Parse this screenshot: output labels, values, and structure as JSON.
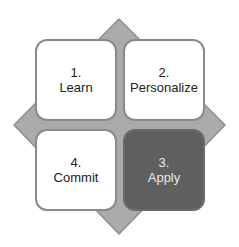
{
  "diagram": {
    "colors": {
      "diamond_fill": "#ababab",
      "diamond_stroke": "#8e8e8e",
      "box_light": "#ffffff",
      "box_dark": "#5f5f5f"
    },
    "steps": [
      {
        "number": "1.",
        "label": "Learn"
      },
      {
        "number": "2.",
        "label": "Personalize"
      },
      {
        "number": "3.",
        "label": "Apply"
      },
      {
        "number": "4.",
        "label": "Commit"
      }
    ]
  }
}
